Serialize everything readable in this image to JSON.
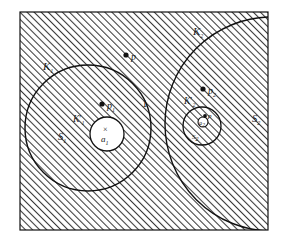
{
  "figure": {
    "name": "nested-disks-diagram",
    "frame": {
      "x": 20,
      "y": 12,
      "width": 248,
      "height": 218
    },
    "background_color": "#ffffff",
    "hatch_color": "#3a3a3a",
    "stroke_color": "#111111",
    "labels": {
      "K1": "K",
      "K1_sub": "1",
      "K2": "K",
      "K2_sub": "2",
      "K1_prime": "K",
      "K1_prime_mark": "′",
      "K1_prime_sub": "1",
      "K2_prime": "K",
      "K2_prime_mark": "′",
      "K2_prime_sub": "2",
      "S1": "S",
      "S1_sub": "1",
      "S2": "S",
      "S2_sub": "2",
      "S2_inner": "S",
      "S2_inner_sub": "2",
      "p": "p",
      "p1": "p",
      "p1_sub": "1",
      "p2": "p",
      "p2_sub": "2",
      "p_inner": "p",
      "a1": "a",
      "a1_sub": "1",
      "a2": "a",
      "a2_sub": "2",
      "cross": "×",
      "region_one": "1"
    },
    "points": [
      {
        "name": "point-p",
        "x": 126,
        "y": 55,
        "label": "p"
      },
      {
        "name": "point-p1",
        "x": 102,
        "y": 104,
        "label": "p1"
      },
      {
        "name": "point-p2",
        "x": 203,
        "y": 89,
        "label": "p2"
      },
      {
        "name": "point-p-inner",
        "x": 205,
        "y": 118,
        "label": "p"
      }
    ],
    "circles": [
      {
        "name": "circle-K1",
        "cx": 88,
        "cy": 128,
        "r": 63,
        "fill": "hatch"
      },
      {
        "name": "circle-K1-prime",
        "cx": 107,
        "cy": 134,
        "r": 17,
        "fill": "white"
      },
      {
        "name": "circle-K2",
        "cx": 272,
        "cy": 124,
        "r": 107,
        "fill": "hatch"
      },
      {
        "name": "circle-K2-prime",
        "cx": 202,
        "cy": 126,
        "r": 19,
        "fill": "hatch"
      },
      {
        "name": "circle-a2",
        "cx": 203,
        "cy": 122,
        "r": 5,
        "fill": "white"
      }
    ]
  }
}
